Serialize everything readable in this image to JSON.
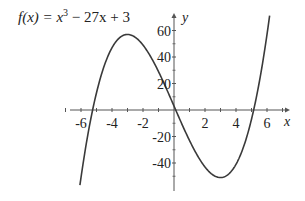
{
  "chart_data": {
    "type": "line",
    "title_parts": {
      "fx": "f(x) = x",
      "exp": "3",
      "rest": " − 27x + 3"
    },
    "function": {
      "a3": 1,
      "a2": 0,
      "a1": -27,
      "a0": 3
    },
    "xlabel": "x",
    "ylabel": "y",
    "x_ticks": [
      -6,
      -4,
      -2,
      2,
      4,
      6
    ],
    "x_tick_labels": [
      "-6",
      "-4",
      "-2",
      "2",
      "4",
      "6"
    ],
    "y_ticks": [
      60,
      40,
      20,
      -20,
      -40
    ],
    "y_tick_labels": [
      "60",
      "40",
      "20",
      "-20",
      "-40"
    ],
    "x_minor_ticks": [
      -7,
      -6,
      -5,
      -4,
      -3,
      -2,
      -1,
      1,
      2,
      3,
      4,
      5,
      6,
      7
    ],
    "y_minor_ticks": [
      60,
      40,
      20,
      -20,
      -40
    ],
    "xlim": [
      -6.5,
      7.4
    ],
    "ylim": [
      -61,
      72
    ],
    "x_domain": [
      -6.07,
      6.17
    ],
    "points": [
      {
        "x": -6,
        "y": -51
      },
      {
        "x": -5.3,
        "y": 0
      },
      {
        "x": -3,
        "y": 57
      },
      {
        "x": 0,
        "y": 3
      },
      {
        "x": 3,
        "y": -51
      },
      {
        "x": 5.1,
        "y": 0
      },
      {
        "x": 6,
        "y": 57
      }
    ],
    "grid": false,
    "legend": null
  },
  "colors": {
    "curve": "#3a3a3a",
    "axis": "#555555",
    "text": "#222222"
  }
}
